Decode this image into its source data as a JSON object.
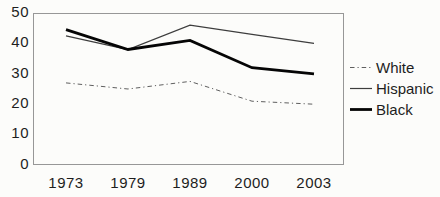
{
  "chart_data": {
    "type": "line",
    "title": "",
    "xlabel": "",
    "ylabel": "",
    "categories": [
      "1973",
      "1979",
      "1989",
      "2000",
      "2003"
    ],
    "series": [
      {
        "name": "White",
        "values": [
          27,
          25,
          27.5,
          21,
          20
        ],
        "line_style": "dash-dot",
        "color": "#5f5f5f"
      },
      {
        "name": "Hispanic",
        "values": [
          42.5,
          38,
          46,
          43,
          40
        ],
        "line_style": "thin-solid",
        "color": "#3d3d3d"
      },
      {
        "name": "Black",
        "values": [
          44.5,
          38,
          41,
          32,
          30
        ],
        "line_style": "thick-solid",
        "color": "#050505"
      }
    ],
    "ylim": [
      0,
      50
    ],
    "yticks": [
      0,
      10,
      20,
      30,
      40,
      50
    ],
    "grid": false,
    "legend_position": "right",
    "frame_color": "#979797"
  }
}
